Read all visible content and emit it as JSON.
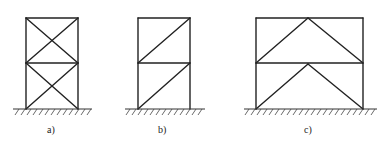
{
  "figure": {
    "panels": [
      {
        "id": "a",
        "label": "a)",
        "bracing": "X-bracing (cross) in both storeys"
      },
      {
        "id": "b",
        "label": "b)",
        "bracing": "single diagonal bracing in both storeys"
      },
      {
        "id": "c",
        "label": "c)",
        "bracing": "inverted-V (chevron) bracing in both storeys"
      }
    ]
  },
  "colors": {
    "line": "#222222",
    "background": "#ffffff"
  }
}
